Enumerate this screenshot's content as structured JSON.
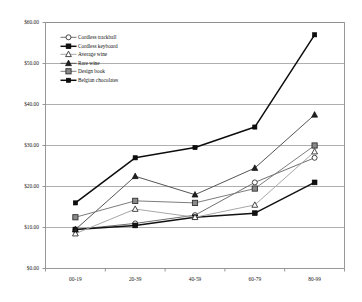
{
  "chart_data": {
    "type": "line",
    "title": "",
    "xlabel": "",
    "ylabel": "",
    "categories": [
      "00-19",
      "20-39",
      "40-59",
      "60-79",
      "80-99"
    ],
    "ylim": [
      0,
      60
    ],
    "ytick_values": [
      0,
      10,
      20,
      30,
      40,
      50,
      60
    ],
    "ytick_labels": [
      "$0.00",
      "$10.00",
      "$20.00",
      "$30.00",
      "$40.00",
      "$50.00",
      "$60.00"
    ],
    "grid": true,
    "grid_axis": "y",
    "legend_position": "upper-left-inside",
    "series": [
      {
        "name": "Cordless trackball",
        "marker": "open-circle",
        "color": "#6f6f6f",
        "marker_fill": "#ffffff",
        "values": [
          9.5,
          11.0,
          13.0,
          21.0,
          27.0
        ]
      },
      {
        "name": "Cordless keyboard",
        "marker": "filled-square",
        "color": "#111111",
        "marker_fill": "#111111",
        "values": [
          9.5,
          10.5,
          12.5,
          13.5,
          21.0
        ]
      },
      {
        "name": "Average wine",
        "marker": "open-triangle",
        "color": "#a8a8a8",
        "marker_fill": "#ffffff",
        "values": [
          8.5,
          14.5,
          12.5,
          15.5,
          28.5
        ]
      },
      {
        "name": "Rare wine",
        "marker": "filled-triangle",
        "color": "#555555",
        "marker_fill": "#222222",
        "values": [
          9.5,
          22.5,
          18.0,
          24.5,
          37.5
        ]
      },
      {
        "name": "Design book",
        "marker": "gray-square",
        "color": "#7d7d7d",
        "marker_fill": "#8a8a8a",
        "values": [
          12.5,
          16.5,
          16.0,
          19.5,
          30.0
        ]
      },
      {
        "name": "Belgian chocolates",
        "marker": "small-filled-square",
        "color": "#0d0d0d",
        "marker_fill": "#0d0d0d",
        "values": [
          16.0,
          27.0,
          29.5,
          34.5,
          57.0
        ]
      }
    ]
  },
  "axes": {
    "frame_color": "#8c8c8c",
    "grid_color": "#8c8c8c",
    "background": "#ffffff"
  }
}
